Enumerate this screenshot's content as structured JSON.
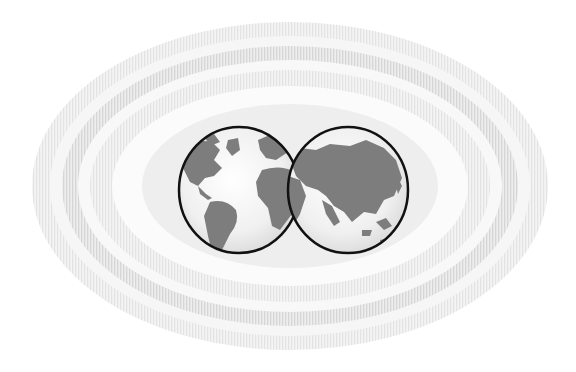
{
  "illustration": {
    "subject": "two-globe-hemispheres-with-concentric-rings",
    "background_color": "#ffffff",
    "ring_colors": [
      "#ececec",
      "#f7f7f7",
      "#e4e4e4",
      "#f5f5f5",
      "#eaeaea"
    ],
    "globe_outline_color": "#111111",
    "land_color": "#7d7d7d",
    "ocean_color": "#f2f2f2",
    "globes": [
      {
        "id": "western-hemisphere",
        "label": "Americas, Europe, Africa"
      },
      {
        "id": "eastern-hemisphere",
        "label": "Europe, Asia, Oceania"
      }
    ]
  }
}
